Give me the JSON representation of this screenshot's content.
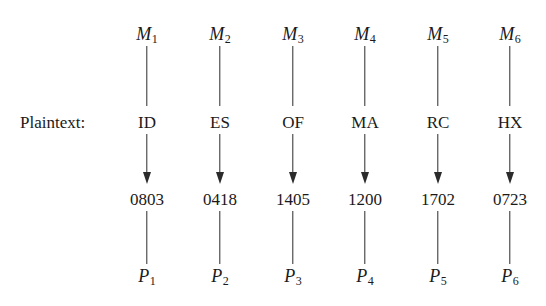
{
  "diagram": {
    "background_color": "#ffffff",
    "stroke_color": "#2b2b2b",
    "text_color": "#1a1a1a",
    "row_label": "Plaintext:",
    "column_count": 6,
    "row_count": 4,
    "geometry": {
      "column_x": [
        147,
        220,
        293,
        365,
        438,
        510
      ],
      "row_y": [
        35,
        122,
        199,
        277
      ],
      "label_x": 20,
      "label_y": 122
    },
    "rows": [
      {
        "id": "message-symbols",
        "kind": "symbol",
        "cells": [
          {
            "base": "M",
            "sub": "1",
            "text": "M1"
          },
          {
            "base": "M",
            "sub": "2",
            "text": "M2"
          },
          {
            "base": "M",
            "sub": "3",
            "text": "M3"
          },
          {
            "base": "M",
            "sub": "4",
            "text": "M4"
          },
          {
            "base": "M",
            "sub": "5",
            "text": "M5"
          },
          {
            "base": "M",
            "sub": "6",
            "text": "M6"
          }
        ]
      },
      {
        "id": "plaintext-digraphs",
        "kind": "literal",
        "cells": [
          {
            "text": "ID"
          },
          {
            "text": "ES"
          },
          {
            "text": "OF"
          },
          {
            "text": "MA"
          },
          {
            "text": "RC"
          },
          {
            "text": "HX"
          }
        ]
      },
      {
        "id": "numeric-encodings",
        "kind": "literal",
        "cells": [
          {
            "text": "0803"
          },
          {
            "text": "0418"
          },
          {
            "text": "1405"
          },
          {
            "text": "1200"
          },
          {
            "text": "1702"
          },
          {
            "text": "0723"
          }
        ]
      },
      {
        "id": "plaintext-symbols",
        "kind": "symbol",
        "cells": [
          {
            "base": "P",
            "sub": "1",
            "text": "P1"
          },
          {
            "base": "P",
            "sub": "2",
            "text": "P2"
          },
          {
            "base": "P",
            "sub": "3",
            "text": "P3"
          },
          {
            "base": "P",
            "sub": "4",
            "text": "P4"
          },
          {
            "base": "P",
            "sub": "5",
            "text": "P5"
          },
          {
            "base": "P",
            "sub": "6",
            "text": "P6"
          }
        ]
      }
    ],
    "connectors": [
      {
        "id": "symbol-to-digraph",
        "from_row": 0,
        "to_row": 1,
        "arrowhead": false,
        "top": 46,
        "length": 60
      },
      {
        "id": "digraph-to-number",
        "from_row": 1,
        "to_row": 2,
        "arrowhead": true,
        "top": 134,
        "length": 50
      },
      {
        "id": "number-to-symbol",
        "from_row": 2,
        "to_row": 3,
        "arrowhead": false,
        "top": 211,
        "length": 53
      }
    ]
  }
}
